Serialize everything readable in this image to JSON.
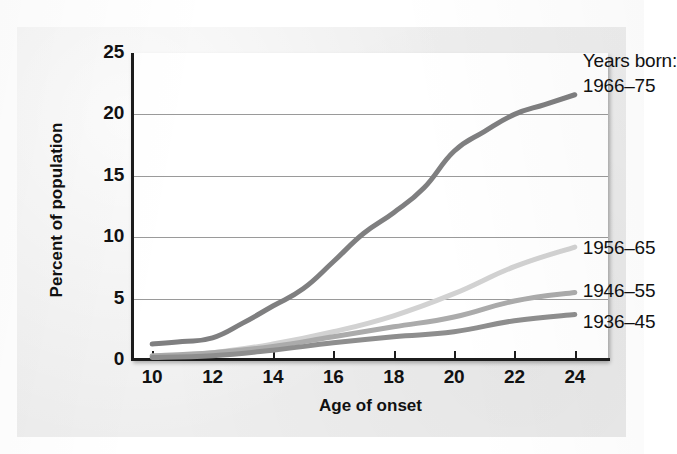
{
  "chart_data": {
    "type": "line",
    "title": "",
    "xlabel": "Age of onset",
    "ylabel": "Percent of population",
    "legend_title": "Years born:",
    "legend_position": "right-inline-annotations",
    "grid": true,
    "x": [
      10,
      12,
      14,
      16,
      18,
      20,
      22,
      24
    ],
    "xlim": [
      9.3,
      25.1
    ],
    "ylim": [
      0,
      25
    ],
    "xticks": [
      10,
      12,
      14,
      16,
      18,
      20,
      22,
      24
    ],
    "yticks": [
      0,
      5,
      10,
      15,
      20,
      25
    ],
    "xtick_labels": [
      "10",
      "12",
      "14",
      "16",
      "18",
      "20",
      "22",
      "24"
    ],
    "ytick_labels": [
      "0",
      "5",
      "10",
      "15",
      "20",
      "25"
    ],
    "series": [
      {
        "name": "1966-75",
        "label": "1966–75",
        "color": "#7f7f80",
        "width": 5,
        "x": [
          10,
          11,
          12,
          13,
          14,
          15,
          16,
          17,
          18,
          19,
          20,
          21,
          22,
          23,
          24
        ],
        "values": [
          1.3,
          1.5,
          1.8,
          3.0,
          4.4,
          5.8,
          8.0,
          10.3,
          12.0,
          14.0,
          17.0,
          18.6,
          20.0,
          20.8,
          21.6
        ]
      },
      {
        "name": "1956-65",
        "label": "1956–65",
        "color": "#d2d2d2",
        "width": 5,
        "x": [
          10,
          12,
          14,
          16,
          18,
          20,
          22,
          24
        ],
        "values": [
          0.3,
          0.6,
          1.3,
          2.3,
          3.6,
          5.4,
          7.6,
          9.2
        ]
      },
      {
        "name": "1946-55",
        "label": "1946–55",
        "color": "#ababab",
        "width": 5,
        "x": [
          10,
          12,
          14,
          16,
          18,
          20,
          22,
          24
        ],
        "values": [
          0.35,
          0.6,
          1.1,
          1.9,
          2.7,
          3.5,
          4.8,
          5.5
        ]
      },
      {
        "name": "1936-45",
        "label": "1936–45",
        "color": "#8e8e8e",
        "width": 5,
        "x": [
          10,
          12,
          14,
          16,
          18,
          20,
          22,
          24
        ],
        "values": [
          0.2,
          0.35,
          0.8,
          1.4,
          1.9,
          2.3,
          3.2,
          3.7
        ]
      }
    ],
    "annotations": [
      {
        "text": "Years born:",
        "series": null
      },
      {
        "text": "1966–75",
        "series": "1966-75"
      },
      {
        "text": "1956–65",
        "series": "1956-65"
      },
      {
        "text": "1946–55",
        "series": "1946-55"
      },
      {
        "text": "1936–45",
        "series": "1936-45"
      }
    ]
  },
  "axes": {
    "x_title": "Age of onset",
    "y_title": "Percent of population"
  },
  "legend": {
    "title": "Years born:",
    "items": [
      {
        "label": "1966–75"
      },
      {
        "label": "1956–65"
      },
      {
        "label": "1946–55"
      },
      {
        "label": "1936–45"
      }
    ]
  },
  "colors": {
    "series_1966_75": "#7f7f80",
    "series_1956_65": "#d2d2d2",
    "series_1946_55": "#ababab",
    "series_1936_45": "#8e8e8e",
    "axis": "#1c1c1c",
    "grid": "#9a9a9a",
    "plot_background": "#ffffff",
    "page_background": "#eeeeee"
  }
}
